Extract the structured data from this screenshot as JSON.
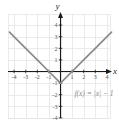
{
  "chart_data": {
    "type": "line",
    "title": "",
    "subtitle": "",
    "xlabel": "x",
    "ylabel": "y",
    "xlim": [
      -4.6,
      4.6
    ],
    "ylim": [
      -4.6,
      4.6
    ],
    "grid": true,
    "grid_step": 1,
    "legend_position": "none",
    "annotations": [
      {
        "name": "function-equation",
        "text": "f(x) = |x| − 1",
        "x": 1.2,
        "y": -2.1
      }
    ],
    "x_ticks": [
      -4,
      -3,
      -2,
      -1,
      1,
      2,
      3,
      4
    ],
    "x_tick_labels": [
      "-4",
      "-3",
      "-2",
      "-1",
      "1",
      "2",
      "3",
      "4"
    ],
    "y_ticks": [
      -4,
      -3,
      -2,
      -1,
      1,
      2,
      3,
      4
    ],
    "y_tick_labels": [
      "-4",
      "-3",
      "-2",
      "-1",
      "1",
      "2",
      "3",
      "4"
    ],
    "series": [
      {
        "name": "f(x) = |x| - 1",
        "equation": "f(x) = |x| - 1",
        "vertex": [
          0,
          -1
        ],
        "x_intercepts": [
          -1,
          1
        ],
        "y_intercept": -1,
        "color": "#8a8a8a",
        "x": [
          -4.4,
          -3,
          -2,
          -1,
          0,
          1,
          2,
          3,
          4.4
        ],
        "values": [
          3.4,
          2,
          1,
          0,
          -1,
          0,
          1,
          2,
          3.4
        ]
      }
    ]
  },
  "colors": {
    "grid": "#e2e2e2",
    "axis": "#1a1a1a",
    "curve": "#8a8a8a",
    "tick_text": "#555555",
    "axis_text": "#2b2b2b",
    "annotation_text": "#8a8a8a",
    "background": "#ffffff"
  },
  "axes": {
    "x_name": "x",
    "y_name": "y"
  }
}
